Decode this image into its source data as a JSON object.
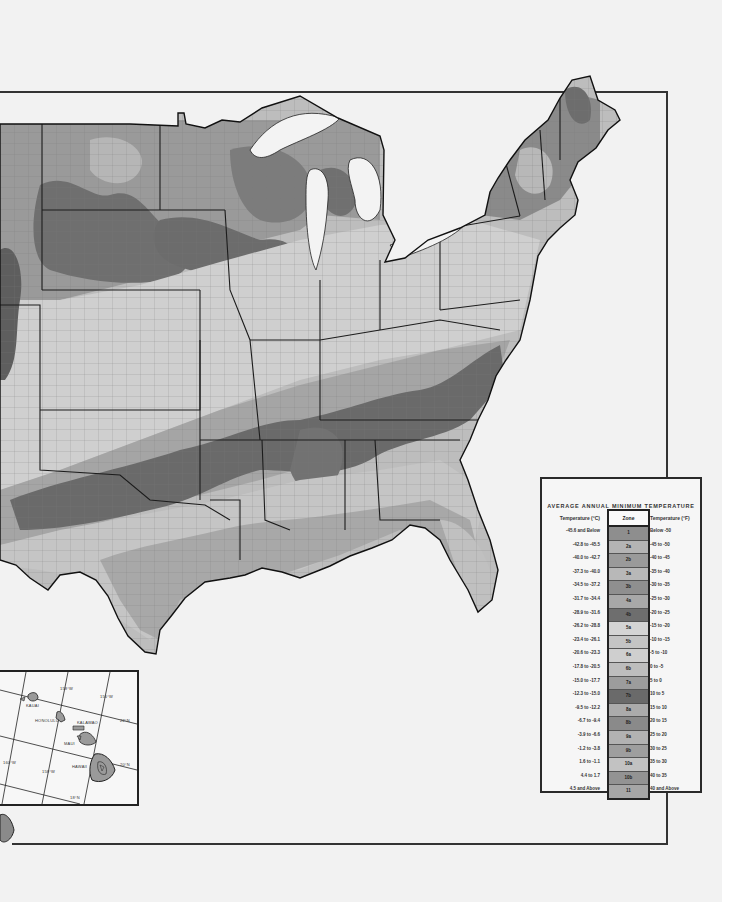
{
  "map": {
    "subject": "USDA Plant Hardiness Zone Map (contiguous United States)",
    "style": "grayscale scanned map with county boundaries and state lines",
    "frame": {
      "top_y": 91,
      "bottom_y": 843,
      "right_x": 667
    }
  },
  "hawaii_inset": {
    "place_labels": [
      "KAUAI",
      "HONOLULU",
      "KALAWAO",
      "MAUI",
      "HAWAII"
    ],
    "graticule_labels": [
      "158°W",
      "156°W",
      "160°W",
      "158°W",
      "22°N",
      "20°N",
      "20°N",
      "18°N"
    ]
  },
  "legend": {
    "title": "AVERAGE ANNUAL MINIMUM TEMPERATURE",
    "header_c": "Temperature (°C)",
    "header_zone": "Zone",
    "header_f": "Temperature (°F)",
    "rows": [
      {
        "c": "-45.6  and Below",
        "zone": "1",
        "f": "Below  -50",
        "color": "#8e8e8e"
      },
      {
        "c": "-42.8  to  -45.5",
        "zone": "2a",
        "f": "-45  to  -50",
        "color": "#b4b4b4"
      },
      {
        "c": "-40.0  to  -42.7",
        "zone": "2b",
        "f": "-40  to  -45",
        "color": "#9a9a9a"
      },
      {
        "c": "-37.3  to  -40.0",
        "zone": "3a",
        "f": "-35  to  -40",
        "color": "#b8b8b8"
      },
      {
        "c": "-34.5  to  -37.2",
        "zone": "3b",
        "f": "-30  to  -35",
        "color": "#8f8f8f"
      },
      {
        "c": "-31.7  to  -34.4",
        "zone": "4a",
        "f": "-25  to  -30",
        "color": "#a8a8a8"
      },
      {
        "c": "-28.9  to  -31.6",
        "zone": "4b",
        "f": "-20  to  -25",
        "color": "#6e6e6e"
      },
      {
        "c": "-26.2  to  -28.8",
        "zone": "5a",
        "f": "-15  to  -20",
        "color": "#d4d4d4"
      },
      {
        "c": "-23.4  to  -26.1",
        "zone": "5b",
        "f": "-10  to  -15",
        "color": "#c4c4c4"
      },
      {
        "c": "-20.6  to  -23.3",
        "zone": "6a",
        "f": "-5  to  -10",
        "color": "#cfcfcf"
      },
      {
        "c": "-17.8  to  -20.5",
        "zone": "6b",
        "f": "0  to  -5",
        "color": "#bdbdbd"
      },
      {
        "c": "-15.0  to  -17.7",
        "zone": "7a",
        "f": "5  to  0",
        "color": "#9c9c9c"
      },
      {
        "c": "-12.3  to  -15.0",
        "zone": "7b",
        "f": "10  to  5",
        "color": "#6a6a6a"
      },
      {
        "c": "-9.5  to  -12.2",
        "zone": "8a",
        "f": "15  to  10",
        "color": "#ababab"
      },
      {
        "c": "-6.7  to  -9.4",
        "zone": "8b",
        "f": "20  to  15",
        "color": "#8a8a8a"
      },
      {
        "c": "-3.9  to  -6.6",
        "zone": "9a",
        "f": "25  to  20",
        "color": "#b2b2b2"
      },
      {
        "c": "-1.2  to  -3.8",
        "zone": "9b",
        "f": "30  to  25",
        "color": "#9e9e9e"
      },
      {
        "c": "1.6  to  -1.1",
        "zone": "10a",
        "f": "35  to  30",
        "color": "#c2c2c2"
      },
      {
        "c": "4.4  to  1.7",
        "zone": "10b",
        "f": "40  to  35",
        "color": "#939393"
      },
      {
        "c": "4.5  and Above",
        "zone": "11",
        "f": "40  and Above",
        "color": "#a6a6a6"
      }
    ]
  },
  "colors": {
    "paper": "#f2f2f2",
    "line": "#222222",
    "zone_light": "#d2d2d2",
    "zone_mid": "#a9a9a9",
    "zone_dark": "#6c6c6c"
  }
}
